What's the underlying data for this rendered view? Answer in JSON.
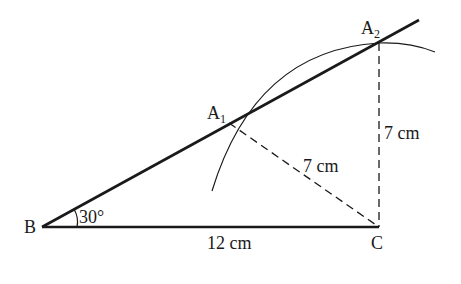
{
  "diagram": {
    "points": {
      "B": {
        "label": "B",
        "x": 42,
        "y": 227
      },
      "C": {
        "label": "C",
        "x": 379,
        "y": 227
      },
      "A1": {
        "label": "A",
        "sub": "1",
        "x": 229,
        "y": 123
      },
      "A2": {
        "label": "A",
        "sub": "2",
        "x": 379,
        "y": 43
      }
    },
    "labels": {
      "angle": "30°",
      "bc": "12 cm",
      "a1c": "7 cm",
      "a2c": "7 cm"
    },
    "colors": {
      "line": "#1a1a1a",
      "background": "#ffffff"
    }
  }
}
